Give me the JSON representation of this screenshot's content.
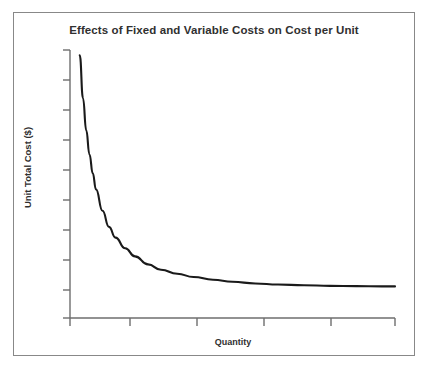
{
  "chart_data": {
    "type": "line",
    "title": "Effects of Fixed and Variable Costs on Cost per Unit",
    "xlabel": "Quantity",
    "ylabel": "Unit Total Cost ($)",
    "grid": false,
    "legend": null,
    "axis_tick_labels": {
      "x": [],
      "y": []
    },
    "xlim": [
      0,
      100
    ],
    "ylim": [
      0,
      100
    ],
    "series": [
      {
        "name": "Unit Total Cost",
        "color": "#1a1a1a",
        "x": [
          3,
          4,
          5,
          6,
          7,
          8,
          10,
          12,
          14,
          17,
          20,
          24,
          28,
          33,
          38,
          44,
          50,
          57,
          64,
          72,
          80,
          88,
          96,
          100
        ],
        "y": [
          98,
          82,
          70,
          61,
          54,
          48,
          40,
          34,
          30,
          26,
          23,
          20,
          18,
          16.5,
          15.3,
          14.3,
          13.5,
          12.9,
          12.5,
          12.2,
          12.0,
          11.9,
          11.8,
          11.8
        ]
      }
    ],
    "annotations": []
  },
  "axes": {
    "y_tick_count": 9,
    "x_tick_count": 5,
    "axis_color": "#6e6e6e",
    "curve_color": "#1a1a1a"
  },
  "frame": {
    "border_color": "#888888",
    "background": "#ffffff"
  }
}
